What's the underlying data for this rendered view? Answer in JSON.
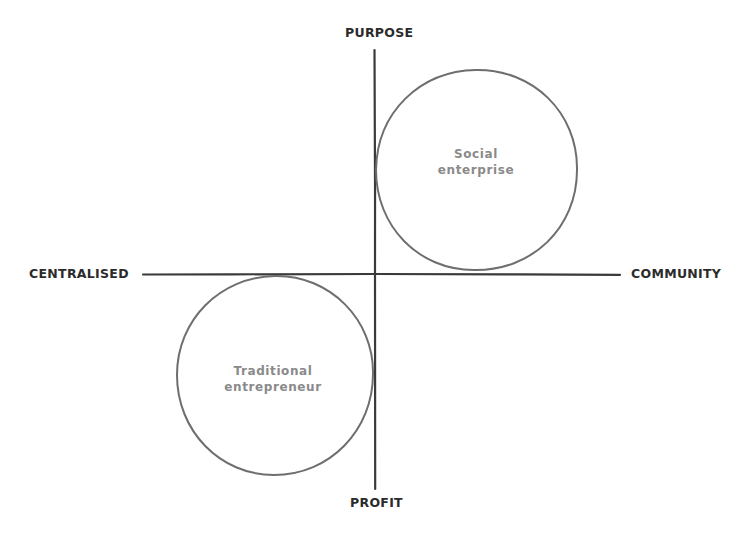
{
  "diagram": {
    "type": "quadrant-diagram",
    "axes": {
      "top_label": "PURPOSE",
      "bottom_label": "PROFIT",
      "left_label": "CENTRALISED",
      "right_label": "COMMUNITY"
    },
    "regions": [
      {
        "id": "social-enterprise",
        "label_line1": "Social",
        "label_line2": "enterprise",
        "quadrant": "top-right"
      },
      {
        "id": "traditional-entrepreneur",
        "label_line1": "Traditional",
        "label_line2": "entrepreneur",
        "quadrant": "bottom-left"
      }
    ],
    "colors": {
      "background": "#ffffff",
      "axis_line": "#3a3a3a",
      "circle_stroke": "#6e6e6e",
      "axis_label": "#2b2b2b",
      "circle_label": "#8a8a8a"
    }
  }
}
